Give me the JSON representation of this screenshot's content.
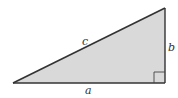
{
  "diagram": {
    "type": "right-triangle",
    "fill_color": "#d9d9d9",
    "stroke_color": "#333333",
    "vertices": {
      "left": [
        13,
        83
      ],
      "right_angle": [
        165,
        83
      ],
      "top": [
        165,
        8
      ]
    },
    "labels": {
      "hypotenuse": "c",
      "vertical_leg": "b",
      "horizontal_leg": "a"
    },
    "right_angle_marker_size": 11
  }
}
